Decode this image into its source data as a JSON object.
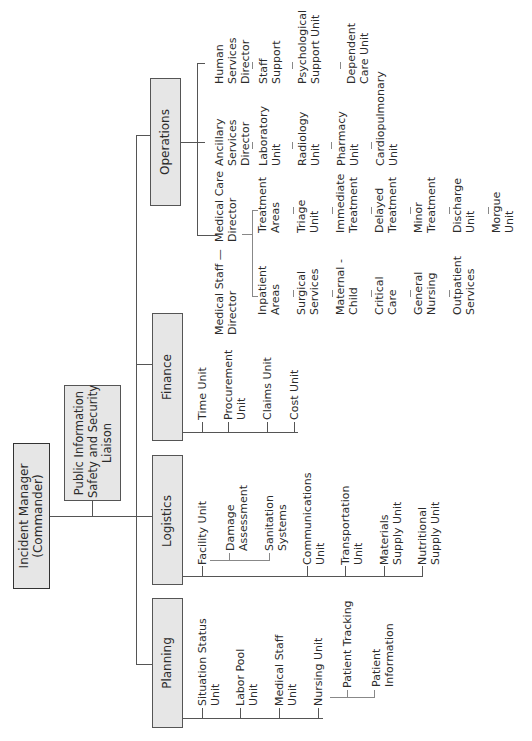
{
  "root": {
    "label": "Incident Manager\n(Commander)"
  },
  "staff": {
    "label": "Public Information\nSafety and Security\nLiaison"
  },
  "sections": {
    "planning": {
      "label": "Planning",
      "children": [
        "Situation Status\nUnit",
        "Labor Pool\nUnit",
        "Medical Staff\nUnit",
        "Nursing Unit"
      ],
      "nursing_children": [
        "Patient Tracking",
        "Patient\nInformation"
      ]
    },
    "logistics": {
      "label": "Logistics",
      "children": [
        "Facility Unit",
        "Communications\nUnit",
        "Transportation\nUnit",
        "Materials\nSupply Unit",
        "Nutritional\nSupply Unit"
      ],
      "facility_children": [
        "Damage\nAssessment",
        "Sanitation\nSystems"
      ]
    },
    "finance": {
      "label": "Finance",
      "children": [
        "Time Unit",
        "Procurement\nUnit",
        "Claims Unit",
        "Cost Unit"
      ]
    },
    "operations": {
      "label": "Operations",
      "medical_staff_director": "Medical Staff —\nDirector",
      "medical_care_director": "Medical Care\nDirector",
      "inpatient": {
        "label": "Inpatient\nAreas",
        "children": [
          "Surgical\nServices",
          "Maternal -\nChild",
          "Critical\nCare",
          "General\nNursing",
          "Outpatient\nServices"
        ]
      },
      "treatment": {
        "label": "Treatment\nAreas",
        "children": [
          "Triage\nUnit",
          "Immediate\nTreatment",
          "Delayed\nTreatment",
          "Minor\nTreatment",
          "Discharge\nUnit",
          "Morgue\nUnit"
        ]
      },
      "ancillary": {
        "label": "Ancillary\nServices\nDirector",
        "children": [
          "Laboratory\nUnit",
          "Radiology\nUnit",
          "Pharmacy\nUnit",
          "Cardiopulmonary\nUnit"
        ]
      },
      "human_services": {
        "label": "Human\nServices\nDirector",
        "children": [
          "Staff\nSupport",
          "Psychological\nSupport Unit",
          "Dependent\nCare Unit"
        ]
      }
    }
  }
}
